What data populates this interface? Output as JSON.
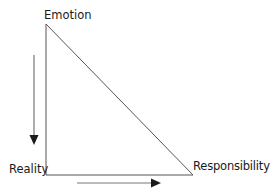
{
  "diagram": {
    "type": "triangle-with-arrows",
    "vertices": {
      "top": {
        "label": "Emotion"
      },
      "bottom_left": {
        "label": "Reality"
      },
      "bottom_right": {
        "label": "Responsibility"
      }
    },
    "arrows": [
      {
        "direction": "down",
        "description": "from Emotion toward Reality, left of triangle"
      },
      {
        "direction": "right",
        "description": "from Reality toward Responsibility, below triangle"
      }
    ],
    "colors": {
      "line": "#555555",
      "arrow": "#1a1a1a",
      "text": "#1a1a1a",
      "background": "#ffffff"
    }
  }
}
